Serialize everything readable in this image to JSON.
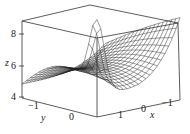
{
  "chart_data": {
    "type": "surface3d",
    "title": "",
    "xlabel": "x",
    "ylabel": "y",
    "zlabel": "z",
    "x_range": [
      -1.5,
      1.5
    ],
    "y_range": [
      -1.5,
      1.0
    ],
    "z_range": [
      4,
      9
    ],
    "x_ticks": [
      "1",
      "0",
      "−1"
    ],
    "y_ticks": [
      "−1",
      "0"
    ],
    "z_ticks": [
      "4",
      "6",
      "8"
    ],
    "grid": false,
    "box": true,
    "mesh": "wireframe",
    "colors": {
      "mesh": "#222222",
      "box": "#333333",
      "background": "#ffffff"
    }
  }
}
